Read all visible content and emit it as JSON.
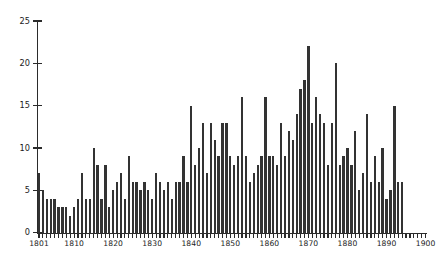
{
  "chart_data": {
    "type": "bar",
    "title": "",
    "subtitle": "",
    "xlabel": "",
    "ylabel": "",
    "grid": false,
    "legend": false,
    "xlim": [
      1801,
      1900
    ],
    "ylim": [
      0,
      25
    ],
    "yticks": [
      0,
      5,
      10,
      15,
      20,
      25
    ],
    "ytick_labels": [
      "0",
      "5",
      "10",
      "15",
      "20",
      "25"
    ],
    "xticks": [
      1801,
      1810,
      1820,
      1830,
      1840,
      1850,
      1860,
      1870,
      1880,
      1890,
      1900
    ],
    "xtick_labels": [
      "1801",
      "1810",
      "1820",
      "1830",
      "1840",
      "1850",
      "1860",
      "1870",
      "1880",
      "1890",
      "1900"
    ],
    "bar_color": "#333333",
    "axis_color": "#2b2b2b",
    "background": "#ffffff",
    "categories": [
      1801,
      1802,
      1803,
      1804,
      1805,
      1806,
      1807,
      1808,
      1809,
      1810,
      1811,
      1812,
      1813,
      1814,
      1815,
      1816,
      1817,
      1818,
      1819,
      1820,
      1821,
      1822,
      1823,
      1824,
      1825,
      1826,
      1827,
      1828,
      1829,
      1830,
      1831,
      1832,
      1833,
      1834,
      1835,
      1836,
      1837,
      1838,
      1839,
      1840,
      1841,
      1842,
      1843,
      1844,
      1845,
      1846,
      1847,
      1848,
      1849,
      1850,
      1851,
      1852,
      1853,
      1854,
      1855,
      1856,
      1857,
      1858,
      1859,
      1860,
      1861,
      1862,
      1863,
      1864,
      1865,
      1866,
      1867,
      1868,
      1869,
      1870,
      1871,
      1872,
      1873,
      1874,
      1875,
      1876,
      1877,
      1878,
      1879,
      1880,
      1881,
      1882,
      1883,
      1884,
      1885,
      1886,
      1887,
      1888,
      1889,
      1890,
      1891,
      1892,
      1893,
      1894,
      1895,
      1896,
      1897,
      1898,
      1899,
      1900
    ],
    "values": [
      7,
      5,
      4,
      4,
      4,
      3,
      3,
      3,
      2,
      3,
      4,
      7,
      4,
      4,
      10,
      8,
      4,
      8,
      3,
      5,
      6,
      7,
      4,
      9,
      6,
      6,
      5,
      6,
      5,
      4,
      7,
      6,
      5,
      6,
      4,
      6,
      6,
      9,
      6,
      15,
      8,
      10,
      13,
      7,
      13,
      11,
      9,
      13,
      13,
      9,
      8,
      9,
      16,
      9,
      6,
      7,
      8,
      9,
      16,
      9,
      9,
      8,
      13,
      9,
      12,
      11,
      14,
      17,
      18,
      22,
      13,
      16,
      14,
      13,
      8,
      13,
      20,
      8,
      9,
      10,
      8,
      12,
      5,
      7,
      14,
      6,
      9,
      6,
      10,
      4,
      5,
      15,
      6,
      6,
      0,
      0,
      0,
      0,
      0,
      0
    ]
  }
}
